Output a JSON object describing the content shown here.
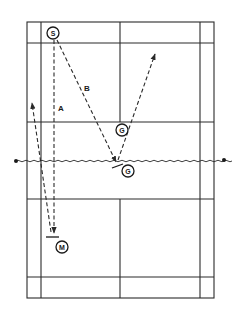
{
  "diagram": {
    "type": "badminton-court-shot-diagram",
    "colors": {
      "line": "#2a2a2a",
      "background": "#ffffff"
    },
    "players": [
      {
        "id": "S",
        "label": "S"
      },
      {
        "id": "G_upper",
        "label": "G"
      },
      {
        "id": "G_lower",
        "label": "G"
      },
      {
        "id": "M",
        "label": "M"
      }
    ],
    "paths": [
      {
        "id": "A",
        "label": "A"
      },
      {
        "id": "B",
        "label": "B"
      }
    ]
  }
}
